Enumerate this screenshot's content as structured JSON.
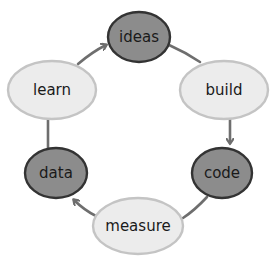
{
  "diagram": {
    "type": "cycle",
    "colors": {
      "dark_node_fill": "#8c8c8c",
      "dark_node_stroke": "#333333",
      "light_node_fill": "#ececec",
      "light_node_stroke": "#c4c4c4",
      "arrow": "#6e6e6e"
    },
    "nodes": [
      {
        "id": "ideas",
        "label": "ideas",
        "style": "dark"
      },
      {
        "id": "build",
        "label": "build",
        "style": "light"
      },
      {
        "id": "code",
        "label": "code",
        "style": "dark"
      },
      {
        "id": "measure",
        "label": "measure",
        "style": "light"
      },
      {
        "id": "data",
        "label": "data",
        "style": "dark"
      },
      {
        "id": "learn",
        "label": "learn",
        "style": "light"
      }
    ],
    "edges": [
      {
        "from": "ideas",
        "to": "build",
        "arrow": false
      },
      {
        "from": "build",
        "to": "code",
        "arrow": true
      },
      {
        "from": "code",
        "to": "measure",
        "arrow": false
      },
      {
        "from": "measure",
        "to": "data",
        "arrow": true
      },
      {
        "from": "data",
        "to": "learn",
        "arrow": false
      },
      {
        "from": "learn",
        "to": "ideas",
        "arrow": true
      }
    ]
  }
}
